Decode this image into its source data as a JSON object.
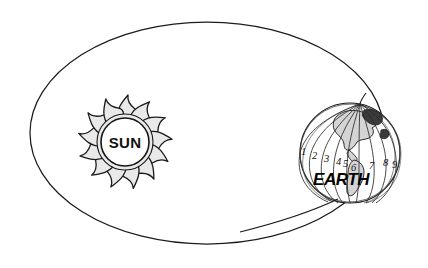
{
  "diagram": {
    "background_color": "#ffffff",
    "line_color": "#1c1c1c",
    "sun": {
      "label": "SUN",
      "center_x": 125,
      "center_y": 142,
      "core_radius": 24,
      "ray_count": 13,
      "ray_fill_color": "#e9e9e9",
      "core_fill_color": "#ffffff"
    },
    "earth": {
      "label": "EARTH",
      "center_x": 350,
      "center_y": 153,
      "radius": 50,
      "land_fill_color": "#d4d4d4",
      "meridian_labels": [
        "1",
        "2",
        "3",
        "4",
        "5",
        "6",
        "7",
        "8",
        "9"
      ],
      "meridian_label_positions": [
        {
          "label": "1",
          "x": 301,
          "y": 155
        },
        {
          "label": "2",
          "x": 313,
          "y": 158
        },
        {
          "label": "3",
          "x": 325,
          "y": 161
        },
        {
          "label": "4",
          "x": 337,
          "y": 164
        },
        {
          "label": "5",
          "x": 344,
          "y": 166
        },
        {
          "label": "6",
          "x": 352,
          "y": 169
        },
        {
          "label": "7",
          "x": 370,
          "y": 167
        },
        {
          "label": "8",
          "x": 384,
          "y": 164
        },
        {
          "label": "9",
          "x": 393,
          "y": 165
        }
      ]
    },
    "orbit": {
      "center_x": 207,
      "center_y": 133,
      "radius_x": 177,
      "radius_y": 111,
      "shape": "ellipse"
    }
  }
}
